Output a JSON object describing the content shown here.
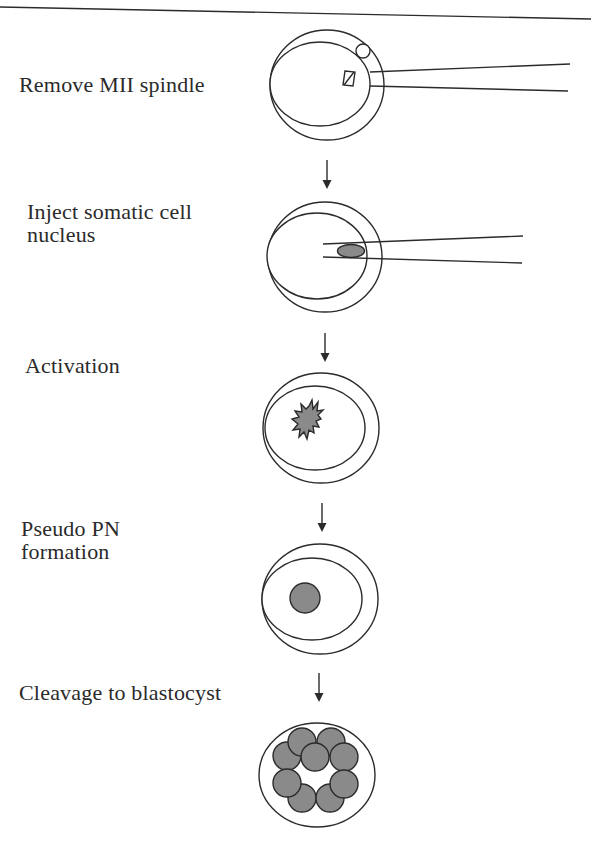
{
  "diagram": {
    "colors": {
      "stroke": "#2b2b2b",
      "nucleus_fill": "#8a8a8a",
      "background": "#ffffff"
    },
    "steps": [
      {
        "id": "remove-spindle",
        "label_lines": [
          "Remove MII spindle"
        ],
        "icon": "oocyte-with-spindle-and-pipette"
      },
      {
        "id": "inject-nucleus",
        "label_lines": [
          "Inject somatic cell",
          "nucleus"
        ],
        "icon": "oocyte-with-nucleus-and-pipette"
      },
      {
        "id": "activation",
        "label_lines": [
          "Activation"
        ],
        "icon": "oocyte-with-activated-nucleus"
      },
      {
        "id": "pseudo-pn",
        "label_lines": [
          "Pseudo PN",
          "formation"
        ],
        "icon": "oocyte-with-pronucleus"
      },
      {
        "id": "cleavage",
        "label_lines": [
          "Cleavage to blastocyst"
        ],
        "icon": "blastocyst"
      }
    ],
    "connector_icon": "down-arrow-icon"
  }
}
